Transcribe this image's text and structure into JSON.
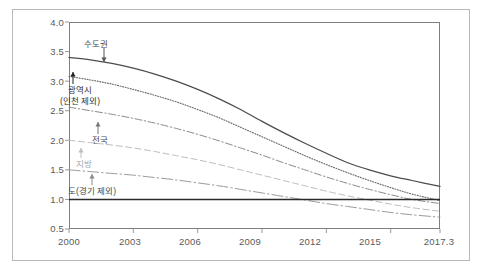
{
  "chart_data": {
    "type": "line",
    "title": "",
    "subtitle": "",
    "xlabel": "",
    "ylabel": "",
    "xlim": [
      2000,
      2017.3
    ],
    "ylim": [
      0.5,
      4.0
    ],
    "grid": false,
    "legend_position": "inline-annotations",
    "reference_line": {
      "value": 1.0,
      "style": "solid-bold",
      "color": "#2b2b2b"
    },
    "x_tick_labels": [
      "2000",
      "2003",
      "2006",
      "2009",
      "2012",
      "2015",
      "2017.3"
    ],
    "x_tick_values": [
      2000,
      2003,
      2006,
      2009,
      2012,
      2015,
      2017.3
    ],
    "y_tick_labels": [
      "0.5",
      "1.0",
      "1.5",
      "2.0",
      "2.5",
      "3.0",
      "3.5",
      "4.0"
    ],
    "y_tick_values": [
      0.5,
      1.0,
      1.5,
      2.0,
      2.5,
      3.0,
      3.5,
      4.0
    ],
    "x": [
      2000,
      2001,
      2002,
      2003,
      2004,
      2005,
      2006,
      2007,
      2008,
      2009,
      2010,
      2011,
      2012,
      2013,
      2014,
      2015,
      2016,
      2017.3
    ],
    "series": [
      {
        "name": "수도권",
        "label": "수도권",
        "style": "solid",
        "color": "#4d4d4d",
        "values": [
          3.4,
          3.36,
          3.3,
          3.22,
          3.12,
          3.0,
          2.86,
          2.7,
          2.52,
          2.32,
          2.13,
          1.95,
          1.78,
          1.62,
          1.5,
          1.4,
          1.32,
          1.22
        ]
      },
      {
        "name": "광역시(인천 제외)",
        "label": "광역시\n(인천 제외)",
        "style": "dotted",
        "color": "#6e6e6e",
        "values": [
          3.08,
          3.02,
          2.95,
          2.86,
          2.76,
          2.65,
          2.52,
          2.38,
          2.22,
          2.06,
          1.9,
          1.74,
          1.59,
          1.45,
          1.32,
          1.2,
          1.09,
          0.98
        ]
      },
      {
        "name": "전국",
        "label": "전국",
        "style": "dashdot",
        "color": "#8a8a8a",
        "values": [
          2.56,
          2.5,
          2.44,
          2.37,
          2.29,
          2.2,
          2.1,
          1.99,
          1.87,
          1.75,
          1.62,
          1.5,
          1.38,
          1.27,
          1.17,
          1.08,
          1.0,
          0.93
        ]
      },
      {
        "name": "지방",
        "label": "지방",
        "style": "dashed",
        "color": "#bdbdbd",
        "values": [
          2.0,
          1.96,
          1.92,
          1.87,
          1.81,
          1.74,
          1.67,
          1.59,
          1.5,
          1.41,
          1.32,
          1.23,
          1.14,
          1.06,
          0.99,
          0.92,
          0.86,
          0.8
        ]
      },
      {
        "name": "도(경기 제외)",
        "label": "도(경기 제외)",
        "style": "longdashdot",
        "color": "#9a9a9a",
        "values": [
          1.5,
          1.47,
          1.44,
          1.41,
          1.37,
          1.33,
          1.28,
          1.23,
          1.17,
          1.11,
          1.05,
          0.99,
          0.93,
          0.88,
          0.83,
          0.78,
          0.74,
          0.7
        ]
      }
    ],
    "annotations": [
      {
        "text": "수도권",
        "target_series": "수도권",
        "arrow": "down"
      },
      {
        "text": "광역시",
        "target_series": "광역시(인천 제외)",
        "arrow": "up"
      },
      {
        "text": "(인천 제외)",
        "target_series": "광역시(인천 제외)",
        "arrow": "none"
      },
      {
        "text": "전국",
        "target_series": "전국",
        "arrow": "up"
      },
      {
        "text": "지방",
        "target_series": "지방",
        "arrow": "up"
      },
      {
        "text": "도(경기 제외)",
        "target_series": "도(경기 제외)",
        "arrow": "up"
      }
    ]
  },
  "axis": {
    "y_ticks": [
      {
        "label": "4.0"
      },
      {
        "label": "3.5"
      },
      {
        "label": "3.0"
      },
      {
        "label": "2.5"
      },
      {
        "label": "2.0"
      },
      {
        "label": "1.5"
      },
      {
        "label": "1.0"
      },
      {
        "label": "0.5"
      }
    ],
    "x_ticks": [
      {
        "label": "2000"
      },
      {
        "label": "2003"
      },
      {
        "label": "2006"
      },
      {
        "label": "2009"
      },
      {
        "label": "2012"
      },
      {
        "label": "2015"
      },
      {
        "label": "2017.3"
      }
    ]
  },
  "annotations": {
    "sudogwon": "수도권",
    "gwangyeoksi": "광역시",
    "gwangyeoksi_sub": "(인천 제외)",
    "jeonguk": "전국",
    "jibang": "지방",
    "do": "도(경기 제외)"
  },
  "colors": {
    "frame": "#b9b9b9",
    "axis": "#7f7f7f",
    "reference": "#2b2b2b",
    "text": "#5a5a5a"
  }
}
